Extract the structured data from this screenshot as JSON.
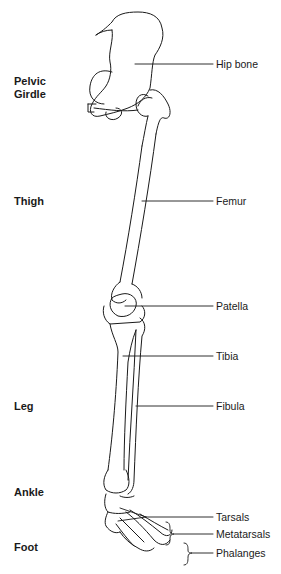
{
  "diagram": {
    "regions": [
      {
        "id": "pelvic",
        "line1": "Pelvic",
        "line2": "Girdle"
      },
      {
        "id": "thigh",
        "line1": "Thigh"
      },
      {
        "id": "leg",
        "line1": "Leg"
      },
      {
        "id": "ankle",
        "line1": "Ankle"
      },
      {
        "id": "foot",
        "line1": "Foot"
      }
    ],
    "labels": [
      {
        "id": "hip",
        "text": "Hip bone"
      },
      {
        "id": "femur",
        "text": "Femur"
      },
      {
        "id": "patella",
        "text": "Patella"
      },
      {
        "id": "tibia",
        "text": "Tibia"
      },
      {
        "id": "fibula",
        "text": "Fibula"
      },
      {
        "id": "tarsals",
        "text": "Tarsals"
      },
      {
        "id": "metatarsals",
        "text": "Metatarsals"
      },
      {
        "id": "phalanges",
        "text": "Phalanges"
      }
    ],
    "colors": {
      "line": "#1a1a1a",
      "background": "#ffffff"
    }
  }
}
